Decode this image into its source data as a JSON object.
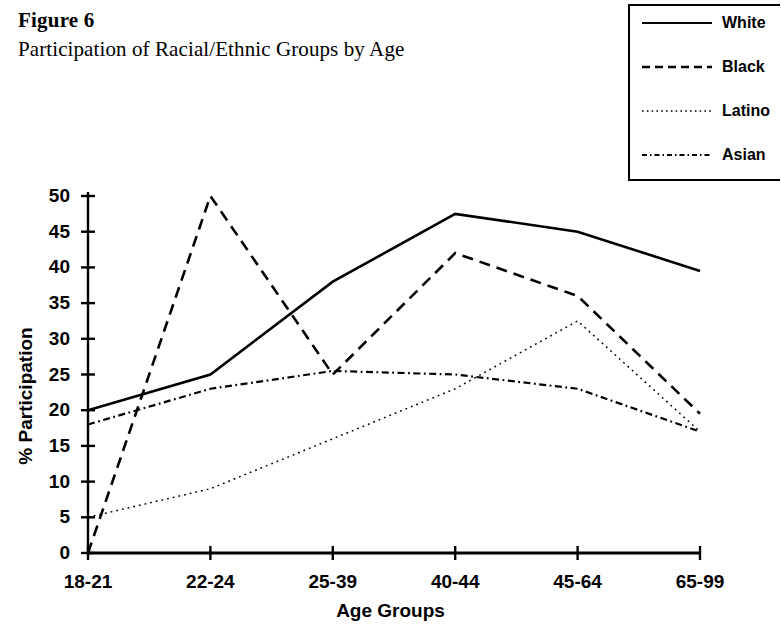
{
  "figure": {
    "number": "Figure 6",
    "title": "Participation of Racial/Ethnic Groups by Age"
  },
  "legend": {
    "position": "top-right",
    "entries": [
      {
        "label": "White",
        "style": "solid",
        "sample_icon": "solid-line-icon"
      },
      {
        "label": "Black",
        "style": "dashed",
        "sample_icon": "dashed-line-icon"
      },
      {
        "label": "Latino",
        "style": "dotted",
        "sample_icon": "dotted-line-icon"
      },
      {
        "label": "Asian",
        "style": "dash-dot",
        "sample_icon": "dash-dot-line-icon"
      }
    ]
  },
  "chart_data": {
    "type": "line",
    "title": "Participation of Racial/Ethnic Groups by Age",
    "subtitle": "Figure 6",
    "xlabel": "Age Groups",
    "ylabel": "% Participation",
    "categories": [
      "18-21",
      "22-24",
      "25-39",
      "40-44",
      "45-64",
      "65-99"
    ],
    "ylim": [
      0,
      50
    ],
    "yticks": [
      0,
      5,
      10,
      15,
      20,
      25,
      30,
      35,
      40,
      45,
      50
    ],
    "ytick_labels": [
      "0",
      "5",
      "10",
      "15",
      "20",
      "25",
      "30",
      "35",
      "40",
      "45",
      "50"
    ],
    "grid": false,
    "legend_position": "top-right",
    "series": [
      {
        "name": "White",
        "style": "solid",
        "values": [
          20,
          25,
          38,
          47.5,
          45,
          39.5
        ]
      },
      {
        "name": "Black",
        "style": "dashed",
        "values": [
          0,
          50,
          25,
          42,
          36,
          19.5
        ]
      },
      {
        "name": "Latino",
        "style": "dotted",
        "values": [
          5,
          9,
          16,
          23,
          32.5,
          17
        ]
      },
      {
        "name": "Asian",
        "style": "dash-dot",
        "values": [
          18,
          23,
          25.5,
          25,
          23,
          17
        ]
      }
    ]
  }
}
